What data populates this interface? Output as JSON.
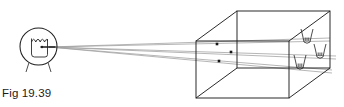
{
  "figure": {
    "caption": "Fig 19.39",
    "title": "Fig 19.39",
    "kind": "optics-ray-diagram",
    "width": 344,
    "height": 107,
    "background_color": "#ffffff",
    "line_color": "#1f1f1f",
    "ray_color": "#9a9a9a",
    "dot_color": "#151515"
  },
  "observer": {
    "label": "eye",
    "icon": "eye-icon",
    "circle": {
      "cx": 38.5,
      "cy": 46.5,
      "r": 18.5
    },
    "pupil_point": {
      "x": 49,
      "y": 47
    },
    "stroke_color": "#1f1f1f"
  },
  "rays": {
    "count": 3,
    "origin": {
      "x": 49,
      "y": 47
    },
    "color": "#9e9e9e",
    "endpoints": [
      {
        "x": 330,
        "y": 38,
        "name": "ray-upper"
      },
      {
        "x": 336,
        "y": 56,
        "name": "ray-middle"
      },
      {
        "x": 332,
        "y": 70,
        "name": "ray-lower"
      }
    ]
  },
  "box": {
    "label": "transparent-rectangular-box",
    "stroke_color": "#1f1f1f",
    "vertices": {
      "front_top_left": {
        "x": 196,
        "y": 41
      },
      "front_top_right": {
        "x": 289,
        "y": 41
      },
      "front_bottom_left": {
        "x": 196,
        "y": 98
      },
      "front_bottom_right": {
        "x": 289,
        "y": 98
      },
      "back_top_left": {
        "x": 237,
        "y": 11
      },
      "back_top_right": {
        "x": 330,
        "y": 11
      },
      "back_bottom_left": {
        "x": 237,
        "y": 68
      },
      "back_bottom_right": {
        "x": 330,
        "y": 68
      }
    }
  },
  "object_points": {
    "label": "point-objects-inside-box",
    "color": "#151515",
    "points": [
      {
        "x": 217,
        "y": 44,
        "name": "point-object-1"
      },
      {
        "x": 231,
        "y": 52,
        "name": "point-object-2"
      },
      {
        "x": 219,
        "y": 61,
        "name": "point-object-3"
      }
    ]
  },
  "images": {
    "label": "virtual-images-on-far-wall",
    "stroke_color": "#1f1f1f",
    "items": [
      {
        "x": 307,
        "y": 38,
        "name": "image-figure-1"
      },
      {
        "x": 320,
        "y": 53,
        "name": "image-figure-2"
      },
      {
        "x": 300,
        "y": 64,
        "name": "image-figure-3"
      }
    ]
  }
}
